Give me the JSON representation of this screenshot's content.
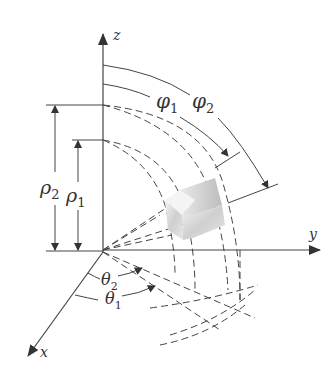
{
  "figure": {
    "type": "spherical-coordinates-volume-element",
    "axes": {
      "z_label": "z",
      "y_label": "y",
      "x_label": "x"
    },
    "labels": {
      "rho1_base": "ρ",
      "rho1_sub": "1",
      "rho2_base": "ρ",
      "rho2_sub": "2",
      "phi1_base": "φ",
      "phi1_sub": "1",
      "phi2_base": "φ",
      "phi2_sub": "2",
      "theta1_base": "θ",
      "theta1_sub": "1",
      "theta2_base": "θ",
      "theta2_sub": "2"
    },
    "colors": {
      "line": "#444444",
      "solid_light": "#f2f2f2",
      "solid_dark": "#b8b8b8"
    }
  }
}
